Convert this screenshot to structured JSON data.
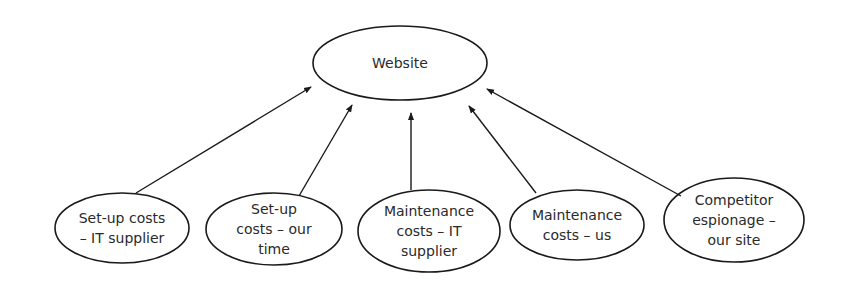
{
  "diagram": {
    "root": {
      "label": "Website"
    },
    "nodes": [
      {
        "lines": [
          "Set-up costs",
          "– IT supplier"
        ]
      },
      {
        "lines": [
          "Set-up",
          "costs – our",
          "time"
        ]
      },
      {
        "lines": [
          "Maintenance",
          "costs – IT",
          "supplier"
        ]
      },
      {
        "lines": [
          "Maintenance",
          "costs – us"
        ]
      },
      {
        "lines": [
          "Competitor",
          "espionage –",
          "our site"
        ]
      }
    ],
    "edges": [
      {
        "from": "Set-up costs – IT supplier",
        "to": "Website"
      },
      {
        "from": "Set-up costs – our time",
        "to": "Website"
      },
      {
        "from": "Maintenance costs – IT supplier",
        "to": "Website"
      },
      {
        "from": "Maintenance costs – us",
        "to": "Website"
      },
      {
        "from": "Competitor espionage – our site",
        "to": "Website"
      }
    ],
    "colors": {
      "stroke": "#1a1a1a",
      "text": "#2a2a2a",
      "background": "#ffffff"
    }
  }
}
